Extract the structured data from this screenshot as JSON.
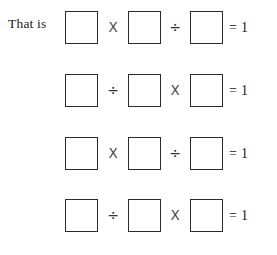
{
  "page": {
    "background_color": "#ffffff",
    "ink_color": "#1a1a1a",
    "box_border_color": "#2b2b2b"
  },
  "lead_in": {
    "text": "That is"
  },
  "symbols": {
    "multiply": "X",
    "divide": "÷",
    "equals": "=",
    "blank_box": ""
  },
  "equations": [
    {
      "label": "That is",
      "boxes": [
        "",
        "",
        ""
      ],
      "operators": [
        "X",
        "÷"
      ],
      "equals_sign": "=",
      "result": "1"
    },
    {
      "label": "",
      "boxes": [
        "",
        "",
        ""
      ],
      "operators": [
        "÷",
        "X"
      ],
      "equals_sign": "=",
      "result": "1"
    },
    {
      "label": "",
      "boxes": [
        "",
        "",
        ""
      ],
      "operators": [
        "X",
        "÷"
      ],
      "equals_sign": "=",
      "result": "1"
    },
    {
      "label": "",
      "boxes": [
        "",
        "",
        ""
      ],
      "operators": [
        "÷",
        "X"
      ],
      "equals_sign": "=",
      "result": "1"
    }
  ]
}
